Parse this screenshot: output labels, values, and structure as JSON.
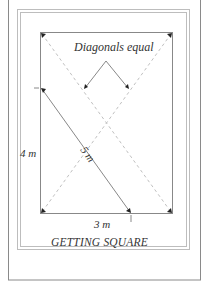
{
  "diagram": {
    "title": "GETTING SQUARE",
    "annotation": "Diagonals equal",
    "side_vertical": "4 m",
    "side_horizontal": "3 m",
    "hypotenuse": "5 m",
    "colors": {
      "frame": "#8a8a8a",
      "lines": "#777777",
      "dashes": "#b5b5b5",
      "text": "#333333"
    }
  }
}
